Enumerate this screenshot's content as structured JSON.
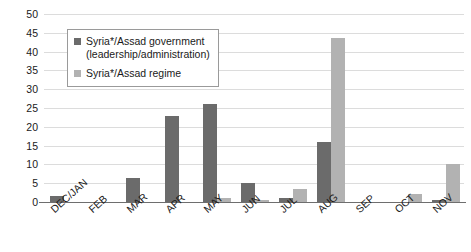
{
  "chart_data": {
    "type": "bar",
    "title": "",
    "subtitle": "",
    "xlabel": "",
    "ylabel": "",
    "ylim": [
      0,
      50
    ],
    "ytick_step": 5,
    "yticks": [
      50,
      45,
      40,
      35,
      30,
      25,
      20,
      15,
      10,
      5,
      0
    ],
    "grid": true,
    "legend_position": "upper-left-inside",
    "categories": [
      "DEC/JAN",
      "FEB",
      "MAR",
      "APR",
      "MAY",
      "JUN",
      "JUL",
      "AUG",
      "SEP",
      "OCT",
      "NOV"
    ],
    "series": [
      {
        "name": "Syria*/Assad government (leadership/administration)",
        "color": "#6b6b6b",
        "values": [
          1.5,
          0,
          6.5,
          23,
          26,
          5,
          1,
          16,
          0,
          0,
          0.5
        ]
      },
      {
        "name": "Syria*/Assad regime",
        "color": "#b2b2b2",
        "values": [
          0,
          0,
          0,
          0,
          1,
          0.5,
          3.5,
          43.5,
          0,
          2,
          10
        ]
      }
    ]
  },
  "legend": {
    "items": [
      {
        "label_line1": "Syria*/Assad government",
        "label_line2": "(leadership/administration)",
        "color": "#6b6b6b"
      },
      {
        "label_line1": "Syria*/Assad regime",
        "label_line2": "",
        "color": "#b2b2b2"
      }
    ]
  },
  "axis": {
    "y_max": 50,
    "y_min": 0
  }
}
